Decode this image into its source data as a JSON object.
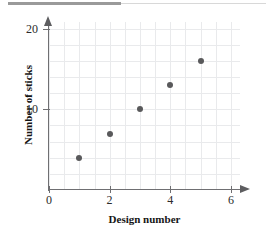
{
  "chart_data": {
    "type": "scatter",
    "title": "",
    "xlabel": "Design number",
    "ylabel": "Number of sticks",
    "x": [
      1,
      2,
      3,
      4,
      5
    ],
    "values": [
      4,
      7,
      10,
      13,
      16
    ],
    "points": [
      {
        "x": 1,
        "y": 4
      },
      {
        "x": 2,
        "y": 7
      },
      {
        "x": 3,
        "y": 10
      },
      {
        "x": 4,
        "y": 13
      },
      {
        "x": 5,
        "y": 16
      }
    ],
    "xlim": [
      0,
      6.3
    ],
    "ylim": [
      0,
      20.8
    ],
    "xticks": [
      0,
      2,
      4,
      6
    ],
    "xtick_labels": [
      "0",
      "2",
      "4",
      "6"
    ],
    "yticks": [
      10,
      20
    ],
    "ytick_labels": [
      "10",
      "20"
    ],
    "x_minor_step": 0.5,
    "y_minor_step": 2,
    "grid": true,
    "legend": null,
    "marker_color": "#59595b",
    "grid_color": "#e9eaec",
    "axis_color": "#6f6f72"
  },
  "axes": {
    "x_title": "Design number",
    "y_title": "Number of sticks",
    "x_tick_labels": [
      "0",
      "2",
      "4",
      "6"
    ],
    "y_tick_labels": [
      "10",
      "20"
    ]
  }
}
